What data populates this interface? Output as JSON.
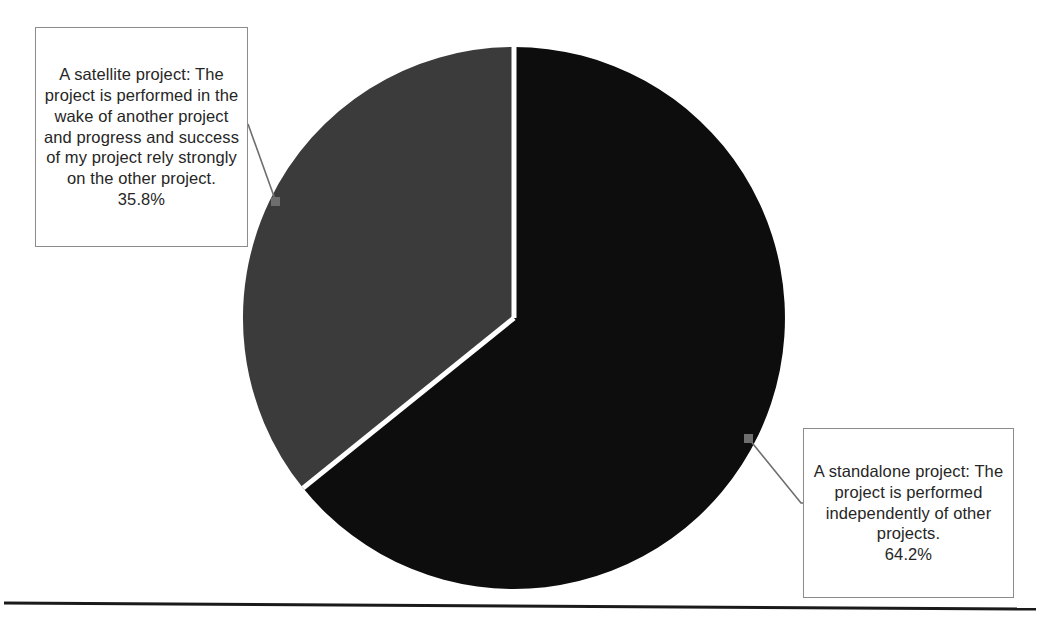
{
  "chart_data": {
    "type": "pie",
    "title": "",
    "categories": [
      "A standalone project: The project is performed independently of other projects.",
      "A satellite project: The project is performed in the wake of another project and progress and success of my project rely strongly  on the other project."
    ],
    "values": [
      64.2,
      35.8
    ],
    "value_labels": [
      "64.2%",
      "35.8%"
    ],
    "units": "percent",
    "total": 100.0,
    "start_angle_deg": 0,
    "direction": "clockwise",
    "legend": "none",
    "labels_position": "callout-boxes-with-leader-lines",
    "slices": [
      {
        "name": "standalone",
        "label": "A standalone project: The project is performed independently of other projects.",
        "percent": 64.2,
        "percent_label": "64.2%",
        "color": "#0d0d0d",
        "sweep_deg": 231.12,
        "start_deg": 0,
        "end_deg": 231.12
      },
      {
        "name": "satellite",
        "label": "A satellite project: The project is performed in the wake of another project and progress and success of my project rely strongly  on the other project.",
        "percent": 35.8,
        "percent_label": "35.8%",
        "color": "#3b3b3b",
        "sweep_deg": 128.88,
        "start_deg": 231.12,
        "end_deg": 360
      }
    ],
    "ylim": null,
    "xlabel": "",
    "ylabel": "",
    "grid": false
  },
  "callouts": {
    "satellite": {
      "text": "A satellite project: The project is performed in the wake of another project and progress and success of my project rely strongly  on the other project.",
      "percent": "35.8%"
    },
    "standalone": {
      "text": "A standalone project: The project is performed independently of other projects.",
      "percent": "64.2%"
    }
  },
  "colors": {
    "slice_standalone": "#0d0d0d",
    "slice_satellite": "#3b3b3b",
    "slice_divider": "#ffffff",
    "callout_border": "#8c8c8c",
    "callout_background": "#ffffff",
    "leader_line": "#6e6e6e",
    "baseline_rule": "#1a1a1a",
    "page_background": "#ffffff",
    "text": "#262626"
  }
}
